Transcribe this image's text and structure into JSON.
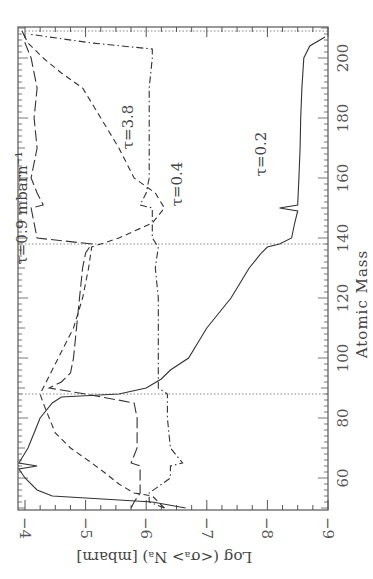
{
  "chart_data": {
    "type": "line",
    "orientation": "rotated 90deg clockwise (x-axis runs vertically on right side, y-axis labels along bottom)",
    "title": "",
    "xlabel": "Atomic Mass",
    "ylabel": "Log (<σ_A> N_A) [mbarn]",
    "xlim": [
      49,
      210
    ],
    "ylim": [
      -9,
      -3.88
    ],
    "xticks": [
      60,
      80,
      100,
      120,
      140,
      160,
      180,
      200
    ],
    "yticks": [
      -4,
      -5,
      -6,
      -7,
      -8,
      -9
    ],
    "xtick_labels": [
      "60",
      "80",
      "100",
      "120",
      "140",
      "160",
      "180",
      "200"
    ],
    "ytick_labels": [
      "−4",
      "−5",
      "−6",
      "−7",
      "−8",
      "−9"
    ],
    "grid": false,
    "reference_lines": {
      "axis": "x",
      "values": [
        88,
        138,
        209
      ],
      "style": "dotted"
    },
    "legend": "inline labels",
    "series": [
      {
        "name": "τ=0.2",
        "style": "solid",
        "x": [
          50,
          52,
          54,
          56,
          60,
          63,
          64,
          65,
          70,
          75,
          80,
          85,
          87,
          88,
          90,
          93,
          96,
          100,
          105,
          110,
          115,
          120,
          125,
          130,
          135,
          137,
          138,
          140,
          145,
          149,
          150,
          151,
          160,
          170,
          180,
          190,
          200,
          204,
          207
        ],
        "y": [
          -6.65,
          -6.1,
          -4.45,
          -4.2,
          -4.0,
          -3.9,
          -4.2,
          -3.9,
          -4.05,
          -4.15,
          -4.25,
          -4.45,
          -4.6,
          -5.55,
          -6.0,
          -6.25,
          -6.4,
          -6.7,
          -6.85,
          -7.0,
          -7.2,
          -7.4,
          -7.55,
          -7.7,
          -7.9,
          -8.0,
          -8.2,
          -8.4,
          -8.45,
          -8.5,
          -8.2,
          -8.5,
          -8.52,
          -8.54,
          -8.55,
          -8.57,
          -8.6,
          -8.7,
          -8.95
        ]
      },
      {
        "name": "τ=0.4",
        "style": "dashed",
        "x": [
          50,
          52,
          54,
          55,
          58,
          62,
          65,
          70,
          75,
          80,
          85,
          88,
          92,
          100,
          110,
          120,
          130,
          137,
          140,
          145,
          150,
          155,
          160,
          170,
          180,
          190,
          195,
          200,
          205,
          209
        ],
        "y": [
          -6.3,
          -6.2,
          -6.1,
          -5.8,
          -5.55,
          -5.3,
          -5.1,
          -4.75,
          -4.5,
          -4.4,
          -4.3,
          -4.25,
          -4.35,
          -4.55,
          -4.8,
          -4.95,
          -5.05,
          -5.1,
          -5.55,
          -6.1,
          -6.3,
          -6.15,
          -5.8,
          -5.55,
          -5.25,
          -4.95,
          -4.6,
          -4.3,
          -4.05,
          -3.95
        ]
      },
      {
        "name": "τ=0.9 mbarn⁻¹",
        "style": "long-dash",
        "x": [
          50,
          52,
          55,
          60,
          64,
          65,
          70,
          80,
          85,
          88,
          90,
          92,
          95,
          100,
          110,
          120,
          130,
          135,
          138,
          140,
          145,
          150,
          151,
          155,
          160,
          170,
          180,
          190,
          200,
          205,
          207,
          209
        ],
        "y": [
          -5.75,
          -5.8,
          -5.9,
          -5.9,
          -5.9,
          -5.75,
          -5.85,
          -5.85,
          -5.8,
          -5.0,
          -4.4,
          -4.6,
          -4.75,
          -4.8,
          -4.85,
          -4.9,
          -4.95,
          -5.0,
          -5.1,
          -4.2,
          -4.15,
          -4.1,
          -4.3,
          -4.2,
          -4.1,
          -4.2,
          -4.15,
          -4.2,
          -4.1,
          -4.0,
          -4.0,
          -3.95
        ]
      },
      {
        "name": "τ=3.8",
        "style": "dash-dot",
        "x": [
          50,
          52,
          55,
          60,
          64,
          65,
          70,
          80,
          88,
          90,
          100,
          110,
          120,
          130,
          137,
          140,
          150,
          151,
          155,
          160,
          170,
          180,
          190,
          200,
          203,
          205,
          208
        ],
        "y": [
          -6.3,
          -6.05,
          -6.05,
          -6.4,
          -6.4,
          -6.6,
          -6.4,
          -6.35,
          -6.35,
          -6.2,
          -6.2,
          -6.2,
          -6.2,
          -6.15,
          -6.2,
          -6.1,
          -6.1,
          -5.9,
          -6.0,
          -6.05,
          -6.05,
          -6.05,
          -6.05,
          -6.1,
          -6.1,
          -5.1,
          -4.05
        ]
      }
    ],
    "annotations": [
      {
        "text": "τ=0.9  mbarn⁻¹",
        "x": 150,
        "y": -3.95
      },
      {
        "text": "τ=3.8",
        "x": 177,
        "y": -5.7
      },
      {
        "text": "τ=0.4",
        "x": 158,
        "y": -6.5
      },
      {
        "text": "τ=0.2",
        "x": 168,
        "y": -7.9
      }
    ]
  },
  "labels": {
    "xlabel": "Atomic Mass",
    "ylabel": "Log (<σ_A> N_A) [mbarn]",
    "x_ticks": [
      "60",
      "80",
      "100",
      "120",
      "140",
      "160",
      "180",
      "200"
    ],
    "y_ticks": [
      "−4",
      "−5",
      "−6",
      "−7",
      "−8",
      "−9"
    ],
    "curve_labels": [
      "τ=0.9  mbarn⁻¹",
      "τ=3.8",
      "τ=0.4",
      "τ=0.2"
    ]
  }
}
